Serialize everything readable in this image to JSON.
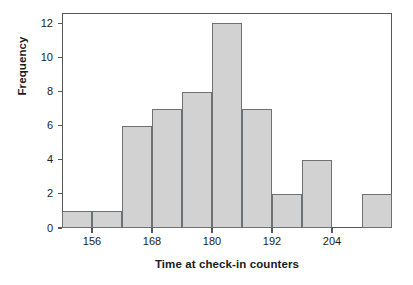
{
  "chart_data": {
    "type": "bar",
    "title": "",
    "xlabel": "Time at check-in counters",
    "ylabel": "Frequency",
    "grid": false,
    "legend": false,
    "bin_width": 6,
    "bin_starts": [
      150,
      156,
      162,
      168,
      174,
      180,
      186,
      192,
      198,
      204,
      210
    ],
    "categories": [
      "150-156",
      "156-162",
      "162-168",
      "168-174",
      "174-180",
      "180-186",
      "186-192",
      "192-198",
      "198-204",
      "204-210",
      "210-216"
    ],
    "values": [
      1,
      1,
      6,
      7,
      8,
      12,
      7,
      2,
      4,
      0,
      2
    ],
    "xlim": [
      150,
      216
    ],
    "ylim": [
      0,
      12.6
    ],
    "xticks": [
      156,
      168,
      180,
      192,
      204
    ],
    "xtick_labels": [
      "156",
      "168",
      "180",
      "192",
      "204"
    ],
    "yticks": [
      0,
      2,
      4,
      6,
      8,
      10,
      12
    ],
    "ytick_labels": [
      "0",
      "2",
      "4",
      "6",
      "8",
      "10",
      "12"
    ],
    "bar_fill_color": "#d2d2d2",
    "bar_edge_color": "#6e7173",
    "axis_color": "#55595c",
    "background_color": "#ffffff"
  }
}
